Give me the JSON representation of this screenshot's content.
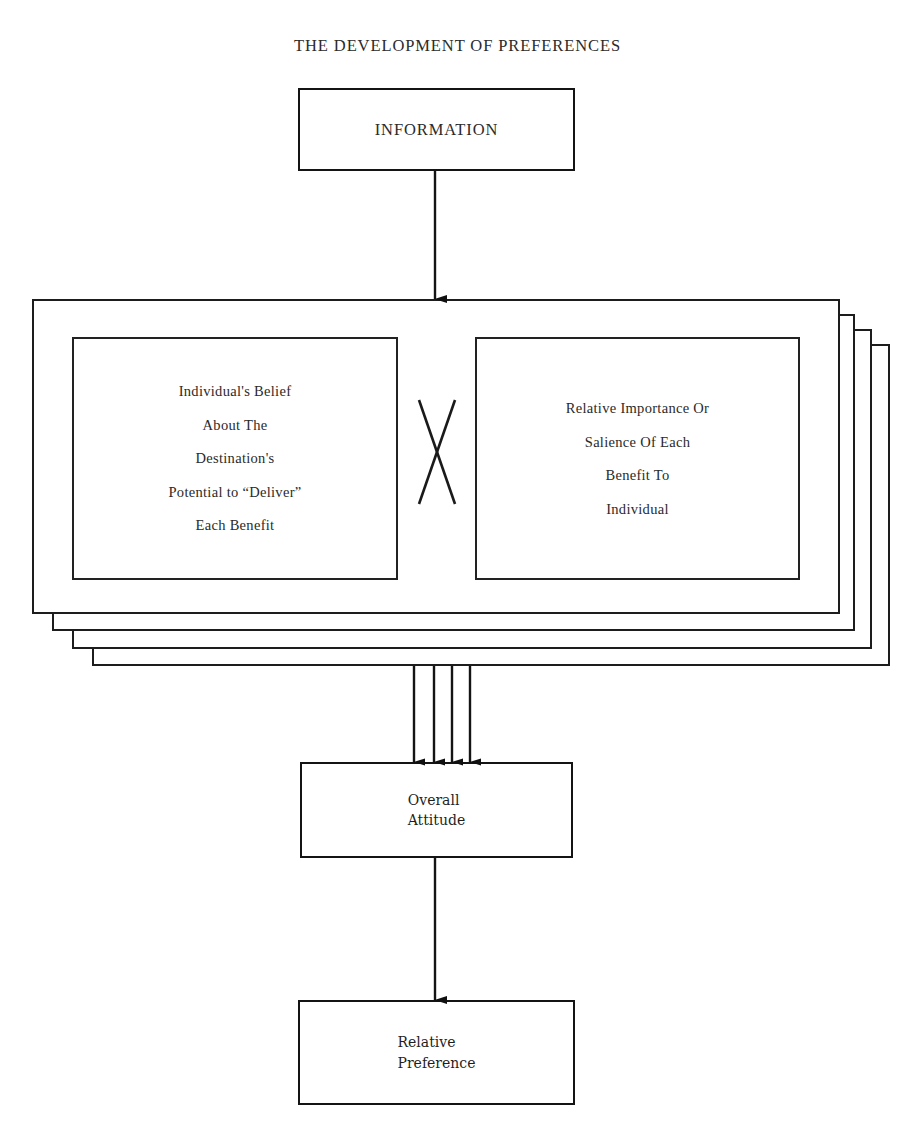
{
  "title": "THE DEVELOPMENT OF PREFERENCES",
  "nodes": {
    "information": {
      "label": "INFORMATION"
    },
    "belief": {
      "lines": [
        "Individual's Belief",
        "About The",
        "Destination's",
        "Potential to “Deliver”",
        "Each Benefit"
      ]
    },
    "importance": {
      "lines": [
        "Relative Importance Or",
        "Salience Of Each",
        "Benefit To",
        "Individual"
      ]
    },
    "operator": {
      "symbol": "X",
      "meaning": "multiply"
    },
    "overall_attitude": {
      "line1": "Overall",
      "line2": "Attitude"
    },
    "relative_preference": {
      "line1": "Relative",
      "line2": "Preference"
    }
  },
  "stack": {
    "card_count": 4,
    "note": "repeated benefit layers"
  },
  "flows": {
    "information_to_stack": {
      "arrow_count": 1
    },
    "stack_to_attitude": {
      "arrow_count": 4
    },
    "attitude_to_preference": {
      "arrow_count": 1
    }
  },
  "colors": {
    "ink": "#141414",
    "paper": "#ffffff",
    "text": "#2a2a2a"
  }
}
